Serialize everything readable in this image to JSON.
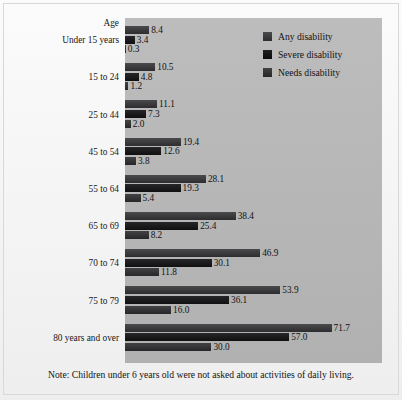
{
  "figure": {
    "axis_title": "Age",
    "note": "Note: Children under 6 years old were not asked about activities of daily living.",
    "panel_color": "#b9b9b9",
    "background_color": "#f4f4f4"
  },
  "legend": {
    "items": [
      {
        "label": "Any disability",
        "key": "any",
        "color": "#3b3b3d"
      },
      {
        "label": "Severe disability",
        "key": "severe",
        "color": "#141416"
      },
      {
        "label": "Needs disability",
        "key": "needs",
        "color": "#343437"
      }
    ]
  },
  "chart_data": {
    "type": "bar",
    "orientation": "horizontal",
    "title": "",
    "subtitle": "",
    "xlabel": "",
    "ylabel": "Age",
    "grid": false,
    "legend_position": "top-right",
    "axis_title": "Age",
    "note": "Note: Children under 6 years old were not asked about activities of daily living.",
    "xlim": [
      0,
      89.2
    ],
    "categories": [
      "Under 15 years",
      "15 to 24",
      "25 to 44",
      "45 to 54",
      "55 to 64",
      "65 to 69",
      "70 to 74",
      "75 to 79",
      "80 years and over"
    ],
    "series": [
      {
        "name": "Any disability",
        "values": [
          8.4,
          10.5,
          11.1,
          19.4,
          28.1,
          38.4,
          46.9,
          53.9,
          71.7
        ]
      },
      {
        "name": "Severe disability",
        "values": [
          3.4,
          4.8,
          7.3,
          12.6,
          19.3,
          25.4,
          30.1,
          36.1,
          57.0
        ]
      },
      {
        "name": "Needs disability",
        "values": [
          0.3,
          1.2,
          2.0,
          3.8,
          5.4,
          8.2,
          11.8,
          16.0,
          30.0
        ]
      }
    ],
    "value_labels": [
      [
        "8.4",
        "3.4",
        "0.3"
      ],
      [
        "10.5",
        "4.8",
        "1.2"
      ],
      [
        "11.1",
        "7.3",
        "2.0"
      ],
      [
        "19.4",
        "12.6",
        "3.8"
      ],
      [
        "28.1",
        "19.3",
        "5.4"
      ],
      [
        "38.4",
        "25.4",
        "8.2"
      ],
      [
        "46.9",
        "30.1",
        "11.8"
      ],
      [
        "53.9",
        "36.1",
        "16.0"
      ],
      [
        "71.7",
        "57.0",
        "30.0"
      ]
    ]
  }
}
